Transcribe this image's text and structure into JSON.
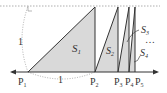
{
  "diagram": {
    "points": [
      {
        "id": "P1",
        "label": "P",
        "sub": "1"
      },
      {
        "id": "P2",
        "label": "P",
        "sub": "2"
      },
      {
        "id": "P3",
        "label": "P",
        "sub": "3"
      },
      {
        "id": "P4",
        "label": "P",
        "sub": "4"
      },
      {
        "id": "P5",
        "label": "P",
        "sub": "5"
      }
    ],
    "areas": [
      {
        "id": "S1",
        "label": "S",
        "sub": "1"
      },
      {
        "id": "S2",
        "label": "S",
        "sub": "2"
      },
      {
        "id": "S3",
        "label": "S",
        "sub": "3"
      },
      {
        "id": "S4",
        "label": "S",
        "sub": "4"
      }
    ],
    "height_label": "1",
    "base_label": "1",
    "ellipsis": "…",
    "colors": {
      "fill": "#d9d9d9",
      "line": "#333333",
      "dashed": "#999999"
    }
  }
}
